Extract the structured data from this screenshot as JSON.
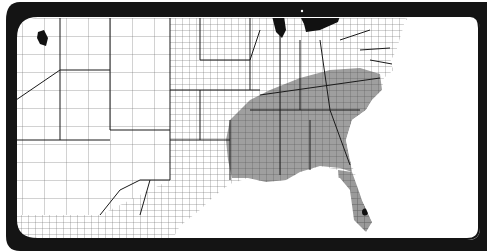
{
  "map": {
    "type": "choropleth",
    "subject": "contiguous United States counties",
    "shaded_region": "southeastern states",
    "colors": {
      "frame": "#141414",
      "background": "#ffffff",
      "land": "#ffffff",
      "shaded": "#9a9a9a",
      "county_lines": "#555555",
      "state_lines": "#1a1a1a",
      "water_lakes": "#111111",
      "dark_marks": "#111111"
    },
    "features": [
      {
        "name": "great-lakes",
        "color": "#111111"
      },
      {
        "name": "highlighted-county-northwest",
        "color": "#111111"
      },
      {
        "name": "highlighted-county-florida",
        "color": "#111111"
      },
      {
        "name": "gulf-of-mexico",
        "color": "#ffffff"
      },
      {
        "name": "atlantic-ocean",
        "color": "#ffffff"
      }
    ]
  }
}
